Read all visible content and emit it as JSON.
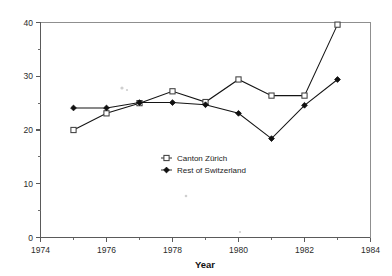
{
  "chart_data": {
    "type": "line",
    "title": "",
    "xlabel": "Year",
    "ylabel": "",
    "xlim": [
      1974,
      1984
    ],
    "ylim": [
      0,
      40
    ],
    "grid": false,
    "legend_position": "center-left-inside",
    "x_ticks": [
      1974,
      1976,
      1978,
      1980,
      1982,
      1984
    ],
    "x_tick_labels": [
      "1974",
      "1976",
      "1978",
      "1980",
      "1982",
      "1984"
    ],
    "x_minor_ticks": [
      1975,
      1977,
      1979,
      1981,
      1983
    ],
    "y_ticks": [
      0,
      10,
      20,
      30,
      40
    ],
    "y_tick_labels": [
      "0",
      "10",
      "20",
      "30",
      "40"
    ],
    "y_minor_ticks": [
      5,
      15,
      25,
      35
    ],
    "x": [
      1975,
      1976,
      1977,
      1978,
      1979,
      1980,
      1981,
      1982,
      1983
    ],
    "series": [
      {
        "name": "Canton Zürich",
        "marker": "open-square",
        "values": [
          20.0,
          23.1,
          25.0,
          27.2,
          25.2,
          29.4,
          26.4,
          26.4,
          39.6
        ]
      },
      {
        "name": "Rest of Switzerland",
        "marker": "filled-diamond",
        "values": [
          24.1,
          24.1,
          25.1,
          25.1,
          24.7,
          23.1,
          18.4,
          24.6,
          29.4
        ]
      }
    ]
  },
  "legend": {
    "items": [
      {
        "label": "Canton Zürich"
      },
      {
        "label": "Rest of Switzerland"
      }
    ]
  },
  "axes": {
    "x_title": "Year"
  },
  "colors": {
    "series_line": "#141414",
    "open_marker_fill": "#ffffff",
    "filled_marker": "#101010",
    "axis": "#5a5a5a",
    "frame": "#8f8f8f",
    "background": "#ffffff"
  }
}
